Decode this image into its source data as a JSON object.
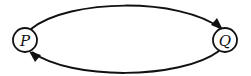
{
  "diagram": {
    "type": "state-cycle",
    "nodes": [
      {
        "id": "P",
        "label": "P",
        "cx": 25,
        "cy": 40,
        "r": 12
      },
      {
        "id": "Q",
        "label": "Q",
        "cx": 225,
        "cy": 40,
        "r": 12
      }
    ],
    "edges": [
      {
        "from": "P",
        "to": "Q",
        "path": "top-arc"
      },
      {
        "from": "Q",
        "to": "P",
        "path": "bottom-arc"
      }
    ],
    "colors": {
      "stroke": "#111111",
      "background": "#ffffff"
    }
  }
}
